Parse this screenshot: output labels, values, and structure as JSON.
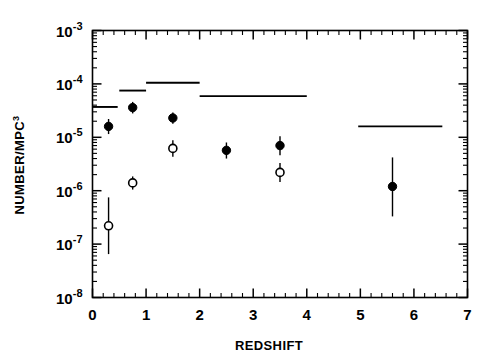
{
  "chart_data": {
    "type": "scatter",
    "title": "",
    "subtitle": "",
    "xlabel": "REDSHIFT",
    "ylabel": "NUMBER/MPC",
    "ylabel_exponent": "3",
    "xlim": [
      0,
      7
    ],
    "ylim": [
      1e-08,
      0.001
    ],
    "yscale": "log",
    "xscale": "linear",
    "grid": false,
    "legend": null,
    "legend_position": "none",
    "x_ticks": [
      "0",
      "1",
      "2",
      "3",
      "4",
      "5",
      "6",
      "7"
    ],
    "x_tick_values": [
      0,
      1,
      2,
      3,
      4,
      5,
      6,
      7
    ],
    "x_minor_per_major": 5,
    "y_ticks": [
      "10-3",
      "10-4",
      "10-5",
      "10-6",
      "10-7",
      "10-8"
    ],
    "y_tick_mantissa": "10",
    "y_tick_exponents": [
      "-3",
      "-4",
      "-5",
      "-6",
      "-7",
      "-8"
    ],
    "y_tick_values": [
      0.001,
      0.0001,
      1e-05,
      1e-06,
      1e-07,
      1e-08
    ],
    "series": [
      {
        "name": "filled-circles",
        "marker": "filled-circle",
        "color": "#000000",
        "points": [
          {
            "x": 0.3,
            "y": 1.6e-05,
            "yerr_low": 1.15e-05,
            "yerr_high": 2.2e-05
          },
          {
            "x": 0.75,
            "y": 3.6e-05,
            "yerr_low": 2.8e-05,
            "yerr_high": 4.6e-05
          },
          {
            "x": 1.5,
            "y": 2.3e-05,
            "yerr_low": 1.8e-05,
            "yerr_high": 2.9e-05
          },
          {
            "x": 2.5,
            "y": 5.7e-06,
            "yerr_low": 4e-06,
            "yerr_high": 8e-06
          },
          {
            "x": 3.5,
            "y": 7e-06,
            "yerr_low": 4.6e-06,
            "yerr_high": 1.05e-05
          },
          {
            "x": 5.6,
            "y": 1.2e-06,
            "yerr_low": 3.3e-07,
            "yerr_high": 4.2e-06
          }
        ]
      },
      {
        "name": "open-circles",
        "marker": "open-circle",
        "color": "#000000",
        "points": [
          {
            "x": 0.3,
            "y": 2.2e-07,
            "yerr_low": 6.5e-08,
            "yerr_high": 7.5e-07
          },
          {
            "x": 0.75,
            "y": 1.4e-06,
            "yerr_low": 1.05e-06,
            "yerr_high": 1.85e-06
          },
          {
            "x": 1.5,
            "y": 6.2e-06,
            "yerr_low": 4.3e-06,
            "yerr_high": 8.8e-06
          },
          {
            "x": 3.5,
            "y": 2.2e-06,
            "yerr_low": 1.45e-06,
            "yerr_high": 3.3e-06
          }
        ]
      },
      {
        "name": "upper-limit-bins",
        "marker": "horizontal-segment",
        "color": "#000000",
        "segments": [
          {
            "x_start": 0.0,
            "x_end": 0.47,
            "y": 3.7e-05
          },
          {
            "x_start": 0.5,
            "x_end": 1.0,
            "y": 7.5e-05
          },
          {
            "x_start": 1.0,
            "x_end": 2.0,
            "y": 0.000105
          },
          {
            "x_start": 2.0,
            "x_end": 4.0,
            "y": 5.9e-05
          },
          {
            "x_start": 4.96,
            "x_end": 6.53,
            "y": 1.6e-05
          }
        ]
      }
    ]
  }
}
